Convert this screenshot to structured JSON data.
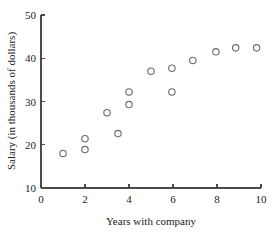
{
  "chart_data": {
    "type": "scatter",
    "title": "",
    "xlabel": "Years with company",
    "ylabel": "Salary (in thousands of dollars)",
    "xlim": [
      0,
      10
    ],
    "ylim": [
      10,
      50
    ],
    "xticks": [
      0,
      2,
      4,
      6,
      8,
      10
    ],
    "yticks": [
      10,
      20,
      30,
      40,
      50
    ],
    "xtick_labels": [
      "0",
      "2",
      "4",
      "6",
      "8",
      "10"
    ],
    "ytick_labels": [
      "10",
      "20",
      "30",
      "40",
      "50"
    ],
    "grid": false,
    "legend": null,
    "marker": "open-circle",
    "marker_color": "#6e6e72",
    "points": [
      {
        "x": 1.0,
        "y": 18.0
      },
      {
        "x": 2.0,
        "y": 21.4
      },
      {
        "x": 2.0,
        "y": 18.9
      },
      {
        "x": 3.0,
        "y": 27.4
      },
      {
        "x": 3.5,
        "y": 22.6
      },
      {
        "x": 4.0,
        "y": 32.2
      },
      {
        "x": 4.0,
        "y": 29.3
      },
      {
        "x": 5.0,
        "y": 37.0
      },
      {
        "x": 5.95,
        "y": 37.7
      },
      {
        "x": 5.95,
        "y": 32.2
      },
      {
        "x": 6.9,
        "y": 39.5
      },
      {
        "x": 7.95,
        "y": 41.5
      },
      {
        "x": 8.85,
        "y": 42.4
      },
      {
        "x": 9.8,
        "y": 42.4
      }
    ]
  },
  "geometry": {
    "plot_left": 41,
    "plot_right": 261,
    "plot_top": 15,
    "plot_bottom": 188,
    "marker_radius": 3.2,
    "tick_length": 4
  }
}
